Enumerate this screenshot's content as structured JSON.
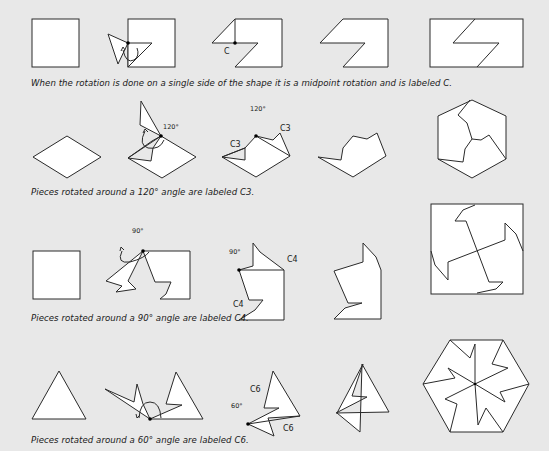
{
  "background_color": "#e8e8e8",
  "rows": [
    {
      "id": "midpoint-rotation",
      "caption": "When the rotation is done on a single side of the shape it is a midpoint rotation and is labeled C.",
      "labels": {
        "pivot": "C"
      }
    },
    {
      "id": "c3-rotation",
      "caption": "Pieces rotated around a 120° angle are labeled C3.",
      "labels": {
        "angle_step2": "120°",
        "angle_step3": "120°",
        "left_edge": "C3",
        "right_edge": "C3"
      }
    },
    {
      "id": "c4-rotation",
      "caption": "Pieces rotated around a 90° angle are labeled C4.",
      "labels": {
        "angle_step2": "90°",
        "angle_step3": "90°",
        "top_edge": "C4",
        "bottom_edge": "C4"
      }
    },
    {
      "id": "c6-rotation",
      "caption": "Pieces rotated around a 60° angle are labeled C6.",
      "labels": {
        "angle_step3": "60°",
        "top_edge": "C6",
        "bottom_edge": "C6"
      }
    }
  ]
}
